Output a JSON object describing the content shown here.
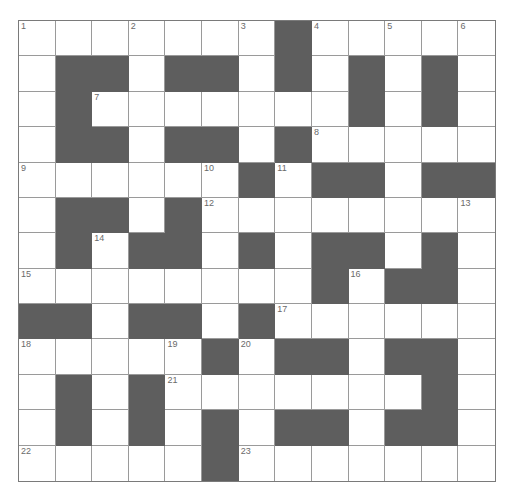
{
  "puzzle": {
    "rows": 13,
    "cols": 13,
    "colors": {
      "black_cell": "#5e5e5e",
      "white_cell": "#ffffff",
      "grid_line": "#9a9a9a",
      "number_text": "#6a6a6a"
    },
    "layout": [
      ".......#.....",
      ".##.##.#.#.#.",
      ".#.......#.#.",
      ".##.##.#.....",
      "......#.##.##",
      ".##.#........",
      ".#.##.#.##.#.",
      "........#.##.",
      "##.##.#......",
      ".....#.##.##.",
      ".#.#.......#.",
      ".#.#.#.##.##.",
      ".....#......."
    ],
    "numbers": [
      {
        "n": "1",
        "r": 0,
        "c": 0
      },
      {
        "n": "2",
        "r": 0,
        "c": 3
      },
      {
        "n": "3",
        "r": 0,
        "c": 6
      },
      {
        "n": "4",
        "r": 0,
        "c": 8
      },
      {
        "n": "5",
        "r": 0,
        "c": 10
      },
      {
        "n": "6",
        "r": 0,
        "c": 12
      },
      {
        "n": "7",
        "r": 2,
        "c": 2
      },
      {
        "n": "8",
        "r": 3,
        "c": 8
      },
      {
        "n": "9",
        "r": 4,
        "c": 0
      },
      {
        "n": "10",
        "r": 4,
        "c": 5
      },
      {
        "n": "11",
        "r": 4,
        "c": 7
      },
      {
        "n": "12",
        "r": 5,
        "c": 5
      },
      {
        "n": "13",
        "r": 5,
        "c": 12
      },
      {
        "n": "14",
        "r": 6,
        "c": 2
      },
      {
        "n": "15",
        "r": 7,
        "c": 0
      },
      {
        "n": "16",
        "r": 7,
        "c": 9
      },
      {
        "n": "17",
        "r": 8,
        "c": 7
      },
      {
        "n": "18",
        "r": 9,
        "c": 0
      },
      {
        "n": "19",
        "r": 9,
        "c": 4
      },
      {
        "n": "20",
        "r": 9,
        "c": 6
      },
      {
        "n": "21",
        "r": 10,
        "c": 4
      },
      {
        "n": "22",
        "r": 12,
        "c": 0
      },
      {
        "n": "23",
        "r": 12,
        "c": 6
      }
    ]
  }
}
